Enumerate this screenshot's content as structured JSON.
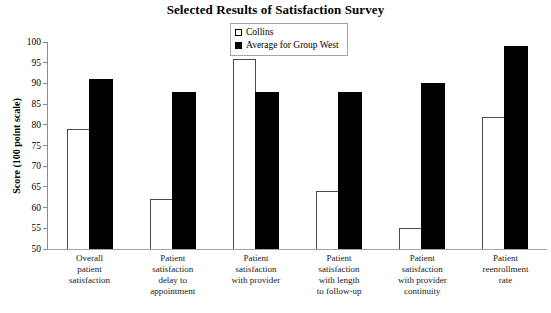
{
  "chart_data": {
    "type": "bar",
    "title": "Selected Results of Satisfaction Survey",
    "ylabel": "Score (100 point scale)",
    "xlabel": "",
    "ylim": [
      50,
      100
    ],
    "yticks": [
      50,
      55,
      60,
      65,
      70,
      75,
      80,
      85,
      90,
      95,
      100
    ],
    "grid": false,
    "legend_position": "top-center",
    "background_color": "#ffffff",
    "axis_color": "#8c8c8c",
    "categories": [
      "Overall patient satisfaction",
      "Patient satisfaction delay to appointment",
      "Patient satisfaction with provider",
      "Patient satisfaction with length to follow-up",
      "Patient satisfaction with provider continuity",
      "Patient reenrollment rate"
    ],
    "category_label_lines": [
      [
        "Overall",
        "patient",
        "satisfaction"
      ],
      [
        "Patient",
        "satisfaction",
        "delay to",
        "appointment"
      ],
      [
        "Patient",
        "satisfaction",
        "with provider"
      ],
      [
        "Patient",
        "satisfaction",
        "with length",
        "to follow-up"
      ],
      [
        "Patient",
        "satisfaction",
        "with provider",
        "continuity"
      ],
      [
        "Patient",
        "reenrollment",
        "rate"
      ]
    ],
    "series": [
      {
        "name": "Collins",
        "style": "open",
        "fill": "#ffffff",
        "border": "#4a4a4a",
        "values": [
          79,
          62,
          96,
          64,
          55,
          82
        ]
      },
      {
        "name": "Average for Group West",
        "style": "solid",
        "fill": "#000000",
        "border": "#000000",
        "values": [
          91,
          88,
          88,
          88,
          90,
          99
        ]
      }
    ]
  }
}
